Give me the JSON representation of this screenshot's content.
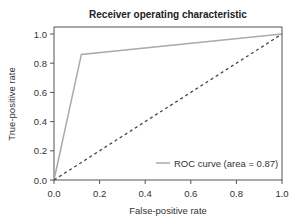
{
  "chart_data": {
    "type": "line",
    "title": "Receiver operating characteristic",
    "xlabel": "False-positive rate",
    "ylabel": "True-positive rate",
    "xlim": [
      0.0,
      1.0
    ],
    "ylim": [
      0.0,
      1.0
    ],
    "x_ticks": [
      "0.0",
      "0.2",
      "0.4",
      "0.6",
      "0.8",
      "1.0"
    ],
    "y_ticks": [
      "0.0",
      "0.2",
      "0.4",
      "0.6",
      "0.8",
      "1.0"
    ],
    "grid": false,
    "legend_position": "lower right",
    "series": [
      {
        "name": "ROC curve (area = 0.87)",
        "style": "solid",
        "color": "#aaaaaa",
        "x": [
          0.0,
          0.12,
          1.0
        ],
        "y": [
          0.0,
          0.86,
          1.0
        ]
      },
      {
        "name": "chance",
        "style": "dashed",
        "color": "#444444",
        "x": [
          0.0,
          1.0
        ],
        "y": [
          0.0,
          1.0
        ]
      }
    ],
    "auc": 0.87
  },
  "legend": {
    "label": "ROC curve (area = 0.87)"
  }
}
